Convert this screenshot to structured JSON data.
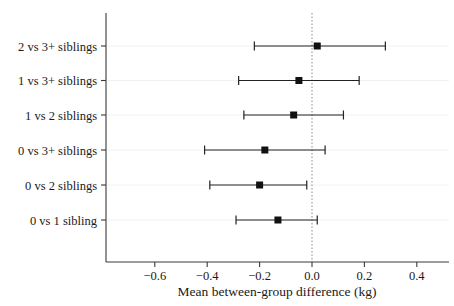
{
  "chart_data": {
    "type": "scatter",
    "subtype": "forest-plot",
    "title": "",
    "xlabel": "Mean between-group difference (kg)",
    "ylabel": "",
    "xlim": [
      -0.75,
      0.53
    ],
    "xticks": [
      -0.6,
      -0.4,
      -0.2,
      0.0,
      0.2,
      0.4
    ],
    "xticklabels": [
      "−0.6",
      "−0.4",
      "−0.2",
      "0.0",
      "0.2",
      "0.4"
    ],
    "grid": false,
    "legend": null,
    "reference_line": {
      "value": 0.0,
      "style": "dotted",
      "color": "#8a8a8a"
    },
    "categories": [
      "2 vs 3+ siblings",
      "1 vs 3+ siblings",
      "1 vs 2 siblings",
      "0 vs 3+ siblings",
      "0 vs 2 siblings",
      "0 vs 1 sibling"
    ],
    "points": [
      {
        "label": "2 vs 3+ siblings",
        "estimate": 0.02,
        "ci_low": -0.22,
        "ci_high": 0.28
      },
      {
        "label": "1 vs 3+ siblings",
        "estimate": -0.05,
        "ci_low": -0.28,
        "ci_high": 0.18
      },
      {
        "label": "1 vs 2 siblings",
        "estimate": -0.07,
        "ci_low": -0.26,
        "ci_high": 0.12
      },
      {
        "label": "0 vs 3+ siblings",
        "estimate": -0.18,
        "ci_low": -0.41,
        "ci_high": 0.05
      },
      {
        "label": "0 vs 2 siblings",
        "estimate": -0.2,
        "ci_low": -0.39,
        "ci_high": -0.02
      },
      {
        "label": "0 vs 1 sibling",
        "estimate": -0.13,
        "ci_low": -0.29,
        "ci_high": 0.02
      }
    ],
    "marker": {
      "shape": "square",
      "color": "#111111",
      "size": 7
    },
    "colors": {
      "marker": "#111111",
      "ci": "#222222",
      "axis": "#3a3a3a",
      "reference": "#8a8a8a",
      "background": "#ffffff"
    }
  }
}
